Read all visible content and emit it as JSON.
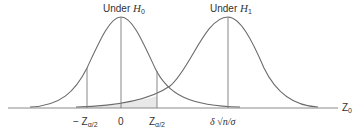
{
  "labels": {
    "h0_prefix": "Under ",
    "h0_var": "H",
    "h0_sub": "0",
    "h1_prefix": "Under ",
    "h1_var": "H",
    "h1_sub": "1",
    "neg_z_prefix": "− Z",
    "neg_z_sub": "α/2",
    "zero": "0",
    "pos_z": "Z",
    "pos_z_sub": "α/2",
    "shift": "δ √n/σ",
    "axis": "Z",
    "axis_sub": "0"
  },
  "colors": {
    "curve": "#6b6b6b",
    "axis": "#8a8a8a",
    "shade": "#e6e6e6"
  }
}
